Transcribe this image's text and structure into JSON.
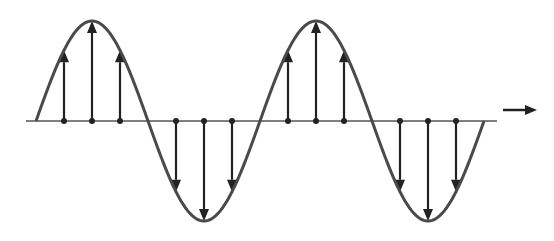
{
  "diagram": {
    "type": "transverse-wave",
    "colors": {
      "wave": "#4a4a4a",
      "baseline": "#555555",
      "arrows": "#222222",
      "background": "#ffffff"
    },
    "baseline": {
      "y": 121,
      "x_start": 26,
      "x_end": 497
    },
    "wave": {
      "x_start": 36,
      "x_end": 484,
      "amplitude": 100,
      "period": 224
    },
    "displacement_arrows": [
      {
        "x": 64,
        "direction": "up"
      },
      {
        "x": 92,
        "direction": "up"
      },
      {
        "x": 120,
        "direction": "up"
      },
      {
        "x": 176,
        "direction": "down"
      },
      {
        "x": 204,
        "direction": "down"
      },
      {
        "x": 232,
        "direction": "down"
      },
      {
        "x": 288,
        "direction": "up"
      },
      {
        "x": 316,
        "direction": "up"
      },
      {
        "x": 344,
        "direction": "up"
      },
      {
        "x": 400,
        "direction": "down"
      },
      {
        "x": 428,
        "direction": "down"
      },
      {
        "x": 456,
        "direction": "down"
      }
    ],
    "propagation_arrow": {
      "x1": 503,
      "x2": 537,
      "y": 110,
      "direction": "right"
    }
  }
}
